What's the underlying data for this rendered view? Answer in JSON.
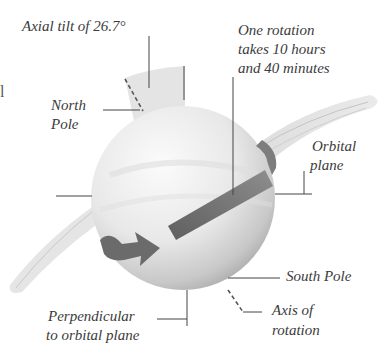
{
  "diagram": {
    "labels": {
      "axial_tilt": "Axial tilt of 26.7°",
      "rotation_line1": "One rotation",
      "rotation_line2": "takes 10 hours",
      "rotation_line3": "and 40 minutes",
      "north_pole_line1": "North",
      "north_pole_line2": "Pole",
      "orbital_plane_line1": "Orbital",
      "orbital_plane_line2": "plane",
      "south_pole": "South Pole",
      "axis_line1": "Axis of",
      "axis_line2": "rotation",
      "perpendicular_line1": "Perpendicular",
      "perpendicular_line2": "to orbital plane"
    },
    "edge_fragment": "l",
    "colors": {
      "planet_light": "#f2f2f2",
      "planet_dark": "#b5b5b5",
      "arrow": "#6e6e6e",
      "tilt_wedge": "#e4e4e4",
      "leader_line": "#444444",
      "text": "#3b3b3b"
    }
  }
}
